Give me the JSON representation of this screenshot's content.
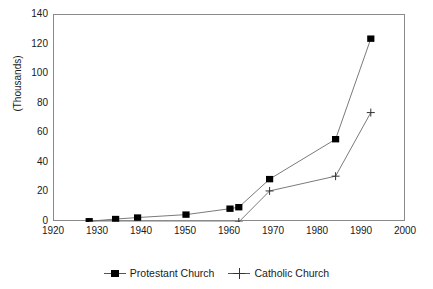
{
  "chart_data": {
    "type": "line",
    "title": "",
    "xlabel": "",
    "ylabel": "(Thousands)",
    "xlim": [
      1920,
      2000
    ],
    "ylim": [
      0,
      140
    ],
    "x_ticks": [
      1920,
      1930,
      1940,
      1950,
      1960,
      1970,
      1980,
      1990,
      2000
    ],
    "y_ticks": [
      0,
      20,
      40,
      60,
      80,
      100,
      120,
      140
    ],
    "grid": false,
    "legend_position": "bottom-center",
    "series": [
      {
        "name": "Protestant Church",
        "marker": "filled-square",
        "color": "#000000",
        "points": [
          {
            "x": 1928,
            "y": 0.5
          },
          {
            "x": 1934,
            "y": 2
          },
          {
            "x": 1939,
            "y": 3
          },
          {
            "x": 1950,
            "y": 5
          },
          {
            "x": 1960,
            "y": 9
          },
          {
            "x": 1962,
            "y": 10
          },
          {
            "x": 1969,
            "y": 29
          },
          {
            "x": 1984,
            "y": 56
          },
          {
            "x": 1992,
            "y": 124
          }
        ]
      },
      {
        "name": "Catholic Church",
        "marker": "plus",
        "color": "#333333",
        "points": [
          {
            "x": 1928,
            "y": 0
          },
          {
            "x": 1962,
            "y": 0
          },
          {
            "x": 1969,
            "y": 21
          },
          {
            "x": 1984,
            "y": 31
          },
          {
            "x": 1992,
            "y": 74
          }
        ]
      }
    ]
  },
  "axis": {
    "y_title": "(Thousands)",
    "y_tick_labels": [
      "140",
      "120",
      "100",
      "80",
      "60",
      "40",
      "20",
      "0"
    ],
    "x_tick_labels": [
      "1920",
      "1930",
      "1940",
      "1950",
      "1960",
      "1970",
      "1980",
      "1990",
      "2000"
    ]
  },
  "legend": {
    "entries": [
      {
        "label": "Protestant Church",
        "marker": "filled-square-marker"
      },
      {
        "label": "Catholic Church",
        "marker": "plus-marker"
      }
    ]
  }
}
